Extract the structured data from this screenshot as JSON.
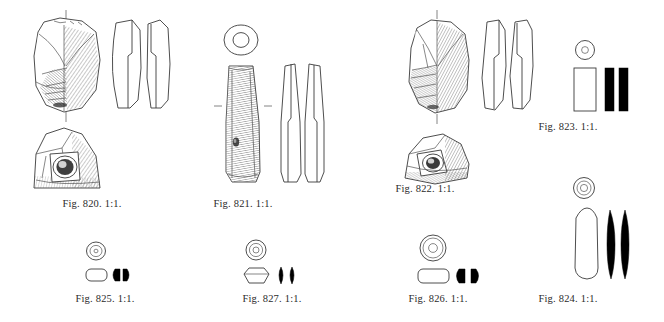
{
  "plate": {
    "kind": "archaeological-illustration-plate",
    "background_color": "#ffffff",
    "ink_color": "#1a1a1a",
    "scale_note": "1:1",
    "figure_count": 8
  },
  "figures": [
    {
      "id": "fig-820",
      "caption": "Fig. 820. 1:1.",
      "number": "820",
      "scale": "1:1",
      "object": "perforated stone axe-head",
      "views": [
        "face view with shading",
        "two profile sections",
        "butt end view with perforation"
      ],
      "caption_x": 92,
      "caption_y": 198
    },
    {
      "id": "fig-821",
      "caption": "Fig. 821. 1:1.",
      "number": "821",
      "scale": "1:1",
      "object": "perforated stone chisel / adze",
      "views": [
        "plan ring section",
        "shaded elongate face",
        "two profile outlines"
      ],
      "caption_x": 243,
      "caption_y": 198
    },
    {
      "id": "fig-822",
      "caption": "Fig. 822. 1:1.",
      "number": "822",
      "scale": "1:1",
      "object": "perforated stone axe-head",
      "views": [
        "face view with shading",
        "two profile sections",
        "butt end view with perforation"
      ],
      "caption_x": 425,
      "caption_y": 183
    },
    {
      "id": "fig-823",
      "caption": "Fig. 823. 1:1.",
      "number": "823",
      "scale": "1:1",
      "object": "cylindrical bead",
      "views": [
        "end view with bore",
        "side outline",
        "two solid black sections"
      ],
      "caption_x": 568,
      "caption_y": 121
    },
    {
      "id": "fig-824",
      "caption": "Fig. 824. 1:1.",
      "number": "824",
      "scale": "1:1",
      "object": "long biconical bead",
      "views": [
        "end view with concentric bore",
        "side outline",
        "two solid black sections"
      ],
      "caption_x": 568,
      "caption_y": 293
    },
    {
      "id": "fig-825",
      "caption": "Fig. 825. 1:1.",
      "number": "825",
      "scale": "1:1",
      "object": "small annular bead",
      "views": [
        "end view with bore",
        "side outline",
        "two solid black sections"
      ],
      "caption_x": 105,
      "caption_y": 293
    },
    {
      "id": "fig-826",
      "caption": "Fig. 826. 1:1.",
      "number": "826",
      "scale": "1:1",
      "object": "large annular bead",
      "views": [
        "end view with bore",
        "side outline",
        "two solid black sections"
      ],
      "caption_x": 438,
      "caption_y": 293
    },
    {
      "id": "fig-827",
      "caption": "Fig. 827. 1:1.",
      "number": "827",
      "scale": "1:1",
      "object": "barrel / faceted bead",
      "views": [
        "end view with concentric bore",
        "side outline",
        "two solid black sections"
      ],
      "caption_x": 272,
      "caption_y": 293
    }
  ]
}
